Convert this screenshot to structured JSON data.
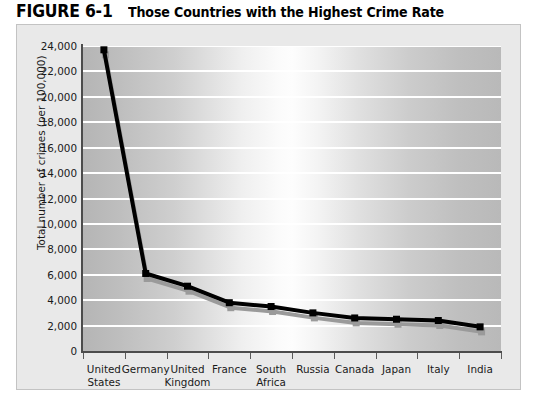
{
  "figure": {
    "label": "FIGURE 6-1",
    "caption": "Those Countries with the Highest Crime Rate"
  },
  "colors": {
    "line": "#000000",
    "shadow": "#9a9a9a",
    "gridline": "#ffffff",
    "axis": "#4c4c4c",
    "panel_background": "#e9e9e9",
    "panel_border": "#c3c3c3",
    "text": "#1a1a1a"
  },
  "chart_data": {
    "type": "line",
    "title": "Those Countries with the Highest Crime Rate",
    "xlabel": "",
    "ylabel": "Total number of crimes (per 100,000)",
    "categories": [
      "United States",
      "Germany",
      "United Kingdom",
      "France",
      "South Africa",
      "Russia",
      "Canada",
      "Japan",
      "Italy",
      "India"
    ],
    "category_lines": [
      [
        "United",
        "States"
      ],
      [
        "Germany",
        ""
      ],
      [
        "United",
        "Kingdom"
      ],
      [
        "France",
        ""
      ],
      [
        "South",
        "Africa"
      ],
      [
        "Russia",
        ""
      ],
      [
        "Canada",
        ""
      ],
      [
        "Japan",
        ""
      ],
      [
        "Italy",
        ""
      ],
      [
        "India",
        ""
      ]
    ],
    "values": [
      23700,
      6100,
      5100,
      3800,
      3500,
      3000,
      2600,
      2500,
      2400,
      1900
    ],
    "ylim": [
      0,
      24000
    ],
    "ytick_values": [
      0,
      2000,
      4000,
      6000,
      8000,
      10000,
      12000,
      14000,
      16000,
      18000,
      20000,
      22000,
      24000
    ],
    "ytick_labels": [
      "0",
      "2,000",
      "4,000",
      "6,000",
      "8,000",
      "10,000",
      "12,000",
      "14,000",
      "16,000",
      "18,000",
      "20,000",
      "22,000",
      "24,000"
    ],
    "grid": true,
    "grid_axis": "y",
    "legend": false,
    "marker": "square",
    "marker_size": 7,
    "line_width": 4,
    "has_drop_shadow": true
  }
}
